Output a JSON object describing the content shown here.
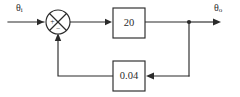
{
  "diagram": {
    "type": "control-system-block-diagram",
    "canvas": {
      "width": 240,
      "height": 97
    },
    "colors": {
      "line": "#2b2b2b",
      "background": "#ffffff",
      "block_fill": "#ffffff"
    },
    "signals": {
      "input": {
        "symbol": "θ",
        "subscript": "i",
        "text": "θi"
      },
      "output": {
        "symbol": "θ",
        "subscript": "o",
        "text": "θo"
      }
    },
    "summing_junction": {
      "name": "summing-junction",
      "shape": "circle-with-cross",
      "center_x": 58,
      "center_y": 22,
      "radius": 12,
      "input_sign": "+",
      "feedback_sign": "−"
    },
    "blocks": [
      {
        "name": "forward-gain-block",
        "label": "20",
        "x": 113,
        "y": 8,
        "width": 32,
        "height": 30
      },
      {
        "name": "feedback-gain-block",
        "label": "0.04",
        "x": 113,
        "y": 61,
        "width": 32,
        "height": 30
      }
    ],
    "takeoff_node": {
      "name": "output-takeoff-node",
      "x": 189,
      "y": 22,
      "radius": 2
    },
    "paths": {
      "input_line": "M8,22 L44,22",
      "junction_to_forward": "M70,22 L109,22",
      "forward_to_takeoff": "M145,22 L189,22",
      "takeoff_to_output": "M189,22 L216,22",
      "takeoff_down": "M189,22 L189,76",
      "takeoff_to_feedback_block": "M189,76 L150,76",
      "feedback_block_to_left": "M113,76 L58,76",
      "left_up_to_junction": "M58,76 L58,38"
    }
  }
}
